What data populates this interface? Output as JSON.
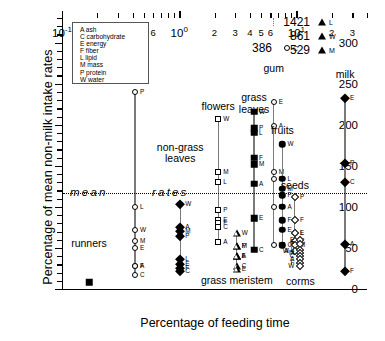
{
  "chart_data": {
    "type": "scatter",
    "title": "",
    "xlabel": "Percentage of feeding time",
    "ylabel": "Percentage of mean non-milk intake rates",
    "xscale": "log",
    "xlim": [
      0.1,
      40
    ],
    "ylim": [
      0,
      330
    ],
    "yticks": [
      0,
      50,
      100,
      150,
      200,
      250,
      300
    ],
    "xticks_major": [
      {
        "value": 0.1,
        "label": "10",
        "exp": "-1"
      },
      {
        "value": 1,
        "label": "10",
        "exp": "0"
      },
      {
        "value": 10,
        "label": "10",
        "exp": "1"
      }
    ],
    "xticks_minor": [
      {
        "value": 0.2,
        "label": "2"
      },
      {
        "value": 0.3,
        "label": "3"
      },
      {
        "value": 0.4,
        "label": "4"
      },
      {
        "value": 0.5,
        "label": "5"
      },
      {
        "value": 0.6,
        "label": "6"
      },
      {
        "value": 2,
        "label": "2"
      },
      {
        "value": 3,
        "label": "3"
      },
      {
        "value": 4,
        "label": "4"
      },
      {
        "value": 5,
        "label": "5"
      },
      {
        "value": 6,
        "label": "6"
      },
      {
        "value": 20,
        "label": "2"
      },
      {
        "value": 30,
        "label": "3"
      }
    ],
    "reference_line": {
      "y": 100,
      "style": "dotted",
      "label_left": "mean",
      "label_right": "rates"
    },
    "legend_title": "",
    "legend_entries": [
      {
        "code": "A",
        "label": "ash"
      },
      {
        "code": "C",
        "label": "carbohydrate"
      },
      {
        "code": "E",
        "label": "energy"
      },
      {
        "code": "F",
        "label": "fiber"
      },
      {
        "code": "L",
        "label": "lipid"
      },
      {
        "code": "M",
        "label": "mass"
      },
      {
        "code": "P",
        "label": "protein"
      },
      {
        "code": "W",
        "label": "water"
      }
    ],
    "offscale_annotations": [
      {
        "value": "1421",
        "marker": "trianglef",
        "code": "L"
      },
      {
        "value": "861",
        "marker": "trianglef",
        "code": "W"
      },
      {
        "value": "529",
        "marker": "trianglef",
        "code": "M"
      },
      {
        "value": "386",
        "marker": "circle",
        "code": "C"
      }
    ],
    "series": [
      {
        "name": "runners",
        "marker": "squaref",
        "x": 0.17,
        "label_y": 55,
        "points": [
          {
            "code": "",
            "y": 8
          }
        ]
      },
      {
        "name": "meat",
        "marker": "circle",
        "x": 0.42,
        "label_y": 262,
        "points": [
          {
            "code": "P",
            "y": 240
          },
          {
            "code": "L",
            "y": 100
          },
          {
            "code": "W",
            "y": 72
          },
          {
            "code": "M",
            "y": 58
          },
          {
            "code": "E",
            "y": 50
          },
          {
            "code": "F",
            "y": 28
          },
          {
            "code": "A",
            "y": 28
          },
          {
            "code": "C",
            "y": 17
          }
        ]
      },
      {
        "name": "non-grass leaves",
        "marker": "diamondf",
        "x": 1.02,
        "label_y": 172,
        "points": [
          {
            "code": "W",
            "y": 104
          },
          {
            "code": "A",
            "y": 76
          },
          {
            "code": "M",
            "y": 71
          },
          {
            "code": "P",
            "y": 64
          },
          {
            "code": "L",
            "y": 36
          },
          {
            "code": "E",
            "y": 31
          },
          {
            "code": "F",
            "y": 26
          },
          {
            "code": "C",
            "y": 22
          }
        ]
      },
      {
        "name": "flowers",
        "marker": "square",
        "x": 2.15,
        "label_y": 222,
        "points": [
          {
            "code": "W",
            "y": 207
          },
          {
            "code": "M",
            "y": 142
          },
          {
            "code": "L",
            "y": 130
          },
          {
            "code": "P",
            "y": 96
          },
          {
            "code": "E",
            "y": 84
          },
          {
            "code": "F",
            "y": 80
          },
          {
            "code": "C",
            "y": 76
          },
          {
            "code": "A",
            "y": 57
          }
        ]
      },
      {
        "name": "grass meristem",
        "marker": "triangle",
        "x": 3.1,
        "label_y": 10,
        "points": [
          {
            "code": "W",
            "y": 68
          },
          {
            "code": "M",
            "y": 52
          },
          {
            "code": "P",
            "y": 52
          },
          {
            "code": "A",
            "y": 40
          },
          {
            "code": "L",
            "y": 40
          },
          {
            "code": "F",
            "y": 40
          },
          {
            "code": "C",
            "y": 28
          },
          {
            "code": "E",
            "y": 24
          }
        ]
      },
      {
        "name": "grass leaves",
        "marker": "squaref",
        "x": 4.35,
        "label_y": 232,
        "points": [
          {
            "code": "W",
            "y": 216
          },
          {
            "code": "P",
            "y": 196
          },
          {
            "code": "L",
            "y": 190
          },
          {
            "code": "F",
            "y": 160
          },
          {
            "code": "M",
            "y": 152
          },
          {
            "code": "A",
            "y": 128
          },
          {
            "code": "E",
            "y": 86
          },
          {
            "code": "C",
            "y": 48
          }
        ]
      },
      {
        "name": "gum",
        "marker": "circle",
        "x": 6.4,
        "label_y": 268,
        "points": [
          {
            "code": "C",
            "y": 386
          },
          {
            "code": "E",
            "y": 228
          },
          {
            "code": "A",
            "y": 198
          },
          {
            "code": "M",
            "y": 142
          },
          {
            "code": "F",
            "y": 134
          },
          {
            "code": "L",
            "y": 100
          },
          {
            "code": "W",
            "y": 53
          }
        ]
      },
      {
        "name": "fruits",
        "marker": "circlef",
        "x": 7.6,
        "label_y": 192,
        "points": [
          {
            "code": "W",
            "y": 176
          },
          {
            "code": "L",
            "y": 134
          },
          {
            "code": "M",
            "y": 122
          },
          {
            "code": "P",
            "y": 114
          },
          {
            "code": "A",
            "y": 100
          },
          {
            "code": "F",
            "y": 84
          },
          {
            "code": "E",
            "y": 72
          },
          {
            "code": "C",
            "y": 53
          }
        ]
      },
      {
        "name": "seeds",
        "marker": "diamond",
        "x": 9.7,
        "label_y": 126,
        "points": [
          {
            "code": "P",
            "y": 112
          },
          {
            "code": "F",
            "y": 84
          },
          {
            "code": "L",
            "y": 68
          },
          {
            "code": "E",
            "y": 68
          },
          {
            "code": "C",
            "y": 58
          },
          {
            "code": "M",
            "y": 54
          },
          {
            "code": "A",
            "y": 46
          },
          {
            "code": "W",
            "y": 46
          }
        ]
      },
      {
        "name": "corms",
        "marker": "diamond",
        "x": 10.8,
        "label_y": 8,
        "points": [
          {
            "code": "E",
            "y": 60
          },
          {
            "code": "P",
            "y": 55
          },
          {
            "code": "L",
            "y": 48
          },
          {
            "code": "M",
            "y": 44
          },
          {
            "code": "C",
            "y": 40
          },
          {
            "code": "A",
            "y": 36
          },
          {
            "code": "F",
            "y": 32
          },
          {
            "code": "W",
            "y": 28
          }
        ]
      },
      {
        "name": "milk",
        "marker": "diamondf",
        "x": 26,
        "label_y": 260,
        "points": [
          {
            "code": "E",
            "y": 232
          },
          {
            "code": "P",
            "y": 154
          },
          {
            "code": "C",
            "y": 130
          },
          {
            "code": "A",
            "y": 55
          },
          {
            "code": "F",
            "y": 22
          }
        ]
      }
    ]
  }
}
